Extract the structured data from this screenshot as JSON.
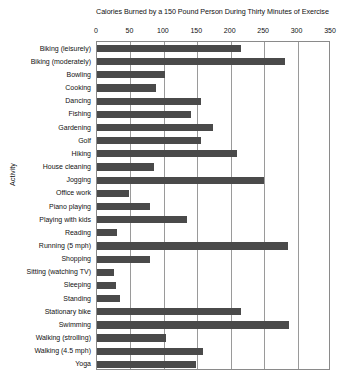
{
  "chart_data": {
    "type": "bar",
    "orientation": "horizontal",
    "title": "Calories Burned by a 150 Pound Person During Thirty Minutes of Exercise",
    "xlabel": "",
    "ylabel": "Activity",
    "xlim": [
      0,
      350
    ],
    "xticks": [
      0,
      50,
      100,
      150,
      200,
      250,
      300,
      350
    ],
    "grid": true,
    "legend": false,
    "bar_color": "#4a4a4a",
    "categories": [
      "Biking (leisurely)",
      "Biking (moderately)",
      "Bowling",
      "Cooking",
      "Dancing",
      "Fishing",
      "Gardening",
      "Golf",
      "Hiking",
      "House cleaning",
      "Jogging",
      "Office work",
      "Piano playing",
      "Playing with kids",
      "Reading",
      "Running (5 mph)",
      "Shopping",
      "Sitting (watching TV)",
      "Sleeping",
      "Standing",
      "Stationary bike",
      "Swimming",
      "Walking (strolling)",
      "Walking (4.5 mph)",
      "Yoga"
    ],
    "values": [
      215,
      281,
      102,
      88,
      155,
      140,
      173,
      155,
      210,
      85,
      250,
      48,
      80,
      135,
      30,
      285,
      80,
      25,
      28,
      35,
      215,
      287,
      103,
      158,
      148
    ],
    "ylabel_rotated": true
  }
}
